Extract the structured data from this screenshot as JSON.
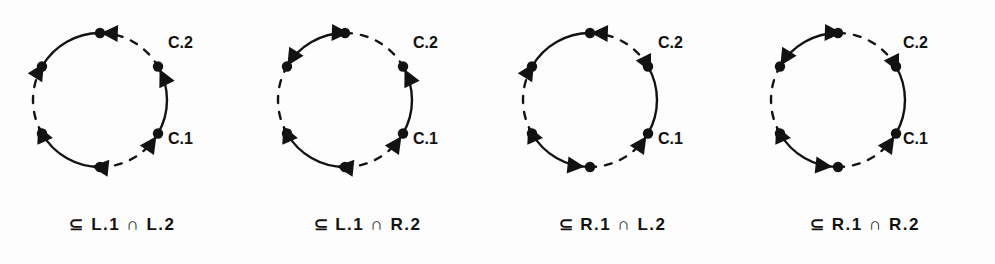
{
  "figure": {
    "background": "#fdfdfd",
    "ink_color": "#121212",
    "width": 995,
    "height": 264
  },
  "chart_data": {
    "type": "diagram",
    "title": "",
    "subtitle": "",
    "xlabel": "",
    "ylabel": "",
    "legend_position": "none",
    "grid": false,
    "panel_count": 4,
    "node_count_per_panel": 6,
    "arc_styles": [
      "solid",
      "dashed"
    ],
    "series": [
      {
        "name": "Panel 1",
        "caption": "⊆ L.1 ∩ L.2",
        "arc_labels": [
          "C.2",
          "C.1"
        ],
        "node_angles_deg": [
          60,
          120,
          180,
          240,
          300,
          0
        ],
        "arc_pattern": [
          "solid",
          "dashed",
          "solid",
          "dashed",
          "solid",
          "dashed"
        ],
        "arrow_angles_deg": [
          64,
          124,
          186,
          246,
          302,
          2
        ],
        "arrow_directions": [
          "ccw",
          "ccw",
          "cw",
          "cw",
          "cw",
          "ccw"
        ]
      },
      {
        "name": "Panel 2",
        "caption": "⊆ L.1 ∩ R.2",
        "arc_labels": [
          "C.2",
          "C.1"
        ],
        "node_angles_deg": [
          60,
          120,
          180,
          240,
          300,
          0
        ],
        "arc_pattern": [
          "solid",
          "dashed",
          "solid",
          "dashed",
          "solid",
          "dashed"
        ],
        "arrow_angles_deg": [
          64,
          124,
          186,
          246,
          302,
          2
        ],
        "arrow_directions": [
          "ccw",
          "ccw",
          "cw",
          "cw",
          "ccw",
          "cw"
        ]
      },
      {
        "name": "Panel 3",
        "caption": "⊆ R.1 ∩ L.2",
        "arc_labels": [
          "C.2",
          "C.1"
        ],
        "node_angles_deg": [
          60,
          120,
          180,
          240,
          300,
          0
        ],
        "arc_pattern": [
          "solid",
          "dashed",
          "solid",
          "dashed",
          "solid",
          "dashed"
        ],
        "arrow_angles_deg": [
          64,
          124,
          186,
          246,
          302,
          2
        ],
        "arrow_directions": [
          "cw",
          "ccw",
          "ccw",
          "cw",
          "cw",
          "ccw"
        ]
      },
      {
        "name": "Panel 4",
        "caption": "⊆ R.1 ∩ R.2",
        "arc_labels": [
          "C.2",
          "C.1"
        ],
        "node_angles_deg": [
          60,
          120,
          180,
          240,
          300,
          0
        ],
        "arc_pattern": [
          "solid",
          "dashed",
          "solid",
          "dashed",
          "solid",
          "dashed"
        ],
        "arrow_angles_deg": [
          64,
          124,
          186,
          246,
          302,
          2
        ],
        "arrow_directions": [
          "cw",
          "ccw",
          "ccw",
          "cw",
          "ccw",
          "cw"
        ]
      }
    ]
  },
  "panels": [
    {
      "id": "panel-1",
      "label_upper": "C.2",
      "label_lower": "C.1",
      "caption": "⊆ L.1 ∩ L.2"
    },
    {
      "id": "panel-2",
      "label_upper": "C.2",
      "label_lower": "C.1",
      "caption": "⊆ L.1 ∩ R.2"
    },
    {
      "id": "panel-3",
      "label_upper": "C.2",
      "label_lower": "C.1",
      "caption": "⊆ R.1 ∩ L.2"
    },
    {
      "id": "panel-4",
      "label_upper": "C.2",
      "label_lower": "C.1",
      "caption": "⊆ R.1 ∩ R.2"
    }
  ]
}
